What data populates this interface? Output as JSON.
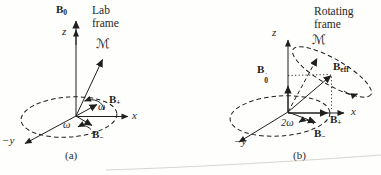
{
  "colors": {
    "background": "#fefefd",
    "ink": "#1f1f1f",
    "page_edge": "#d9d6d1"
  },
  "panels": {
    "a": {
      "frame_label": "Lab frame",
      "caption": "(a)",
      "labels": {
        "B0": {
          "base": "B",
          "sub": "0"
        },
        "z": "z",
        "M": "ℳ",
        "B_plus": {
          "base": "B",
          "sub": "+"
        },
        "omega_upper": "ω",
        "x": "x",
        "omega_lower": "ω",
        "B_minus": {
          "base": "B",
          "sub": "−"
        },
        "neg_y": "−y"
      }
    },
    "b": {
      "frame_label": "Rotating frame",
      "caption": "(b)",
      "labels": {
        "B0_prime": {
          "base": "B",
          "sub": "0",
          "prime": "′"
        },
        "z": "z",
        "M": "ℳ",
        "B_eff": {
          "base": "B",
          "sub": "eff"
        },
        "B_plus": {
          "base": "B",
          "sub": "+"
        },
        "two_omega": "2ω",
        "x": "x",
        "B_minus": {
          "base": "B",
          "sub": "−"
        },
        "neg_y": "−y"
      }
    }
  }
}
